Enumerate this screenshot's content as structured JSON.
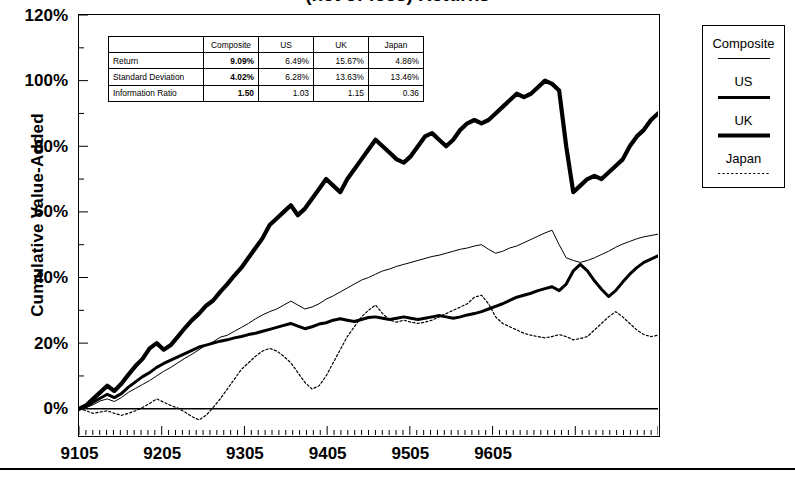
{
  "chart_data": {
    "type": "line",
    "title": "(net of fees) Returns",
    "xlabel": "",
    "ylabel": "Cumulative Value-Added",
    "ylim": [
      -8,
      120
    ],
    "yticks": [
      "0%",
      "20%",
      "40%",
      "60%",
      "80%",
      "100%",
      "120%"
    ],
    "ytick_values": [
      0,
      20,
      40,
      60,
      80,
      100,
      120
    ],
    "minor_tick_interval": 10,
    "xticks": [
      "9105",
      "9205",
      "9305",
      "9405",
      "9505",
      "9605"
    ],
    "xtick_values": [
      9105,
      9205,
      9305,
      9405,
      9505,
      9605
    ],
    "xlim": [
      9105,
      9612
    ],
    "grid": false,
    "legend_position": "right-outside",
    "series": [
      {
        "name": "Composite",
        "style": "thin-solid",
        "values": [
          0,
          0.4,
          1.2,
          2.4,
          3.0,
          2.2,
          3.4,
          5.0,
          6.2,
          7.4,
          8.6,
          10.0,
          11.4,
          12.6,
          14.0,
          15.4,
          16.6,
          18.0,
          19.4,
          20.4,
          21.8,
          22.4,
          23.6,
          24.8,
          26.0,
          27.4,
          28.6,
          29.6,
          30.4,
          31.6,
          32.8,
          31.6,
          30.4,
          31.0,
          32.0,
          33.4,
          34.4,
          35.6,
          36.8,
          38.0,
          39.2,
          40.0,
          41.0,
          42.0,
          42.6,
          43.4,
          44.0,
          44.6,
          45.2,
          45.8,
          46.4,
          46.8,
          47.4,
          48.0,
          48.6,
          49.0,
          49.6,
          50.0,
          48.6,
          47.4,
          48.0,
          49.0,
          49.6,
          50.6,
          51.6,
          52.6,
          53.6,
          54.4,
          50.0,
          46.0,
          45.2,
          44.6,
          45.2,
          46.0,
          47.0,
          48.0,
          49.2,
          50.2,
          51.0,
          51.8,
          52.4,
          52.8,
          53.2
        ]
      },
      {
        "name": "US",
        "style": "thick-solid",
        "values": [
          0,
          0.6,
          2.0,
          3.2,
          4.4,
          3.4,
          4.6,
          6.6,
          8.2,
          9.8,
          11.0,
          12.6,
          13.8,
          14.8,
          15.8,
          16.8,
          17.8,
          18.8,
          19.4,
          20.0,
          20.6,
          21.0,
          21.6,
          22.0,
          22.6,
          23.0,
          23.6,
          24.2,
          24.8,
          25.4,
          26.0,
          25.2,
          24.4,
          25.0,
          25.8,
          26.2,
          27.0,
          27.4,
          27.0,
          26.6,
          27.2,
          27.8,
          28.0,
          27.6,
          27.2,
          27.6,
          28.0,
          27.6,
          27.2,
          27.6,
          28.0,
          28.4,
          28.0,
          27.6,
          28.0,
          28.6,
          29.0,
          29.6,
          30.4,
          31.2,
          32.0,
          33.0,
          34.0,
          34.6,
          35.2,
          36.0,
          36.6,
          37.2,
          36.0,
          38.0,
          42.0,
          44.0,
          42.0,
          39.0,
          36.4,
          34.2,
          36.0,
          38.6,
          41.0,
          43.0,
          44.6,
          45.6,
          46.6
        ]
      },
      {
        "name": "UK",
        "style": "extra-thick-solid",
        "values": [
          0,
          1.0,
          3.0,
          5.0,
          7.0,
          5.4,
          7.6,
          10.4,
          13.0,
          15.2,
          18.4,
          20.0,
          18.0,
          19.4,
          22.0,
          24.6,
          27.0,
          29.0,
          31.4,
          33.0,
          35.6,
          38.0,
          40.6,
          43.0,
          46.0,
          49.0,
          52.0,
          56.0,
          58.0,
          60.0,
          62.0,
          59.0,
          61.0,
          64.0,
          67.0,
          70.0,
          68.0,
          66.0,
          70.0,
          73.0,
          76.0,
          79.0,
          82.0,
          80.0,
          78.0,
          76.0,
          75.0,
          77.0,
          80.0,
          83.0,
          84.0,
          82.0,
          80.0,
          82.0,
          85.0,
          87.0,
          88.0,
          87.0,
          88.0,
          90.0,
          92.0,
          94.0,
          96.0,
          95.0,
          96.0,
          98.0,
          100.0,
          99.0,
          97.0,
          80.0,
          66.0,
          68.0,
          70.0,
          71.0,
          70.0,
          72.0,
          74.0,
          76.0,
          80.0,
          83.0,
          85.0,
          88.0,
          90.0
        ]
      },
      {
        "name": "Japan",
        "style": "dotted",
        "values": [
          0,
          -0.6,
          -1.4,
          -1.0,
          -0.6,
          -1.4,
          -2.0,
          -1.4,
          -0.6,
          0.4,
          1.6,
          3.0,
          2.0,
          1.0,
          0.2,
          -1.0,
          -2.4,
          -3.4,
          -2.0,
          0.4,
          3.0,
          6.0,
          9.0,
          12.0,
          14.0,
          16.0,
          17.6,
          18.4,
          17.6,
          16.0,
          14.0,
          11.0,
          8.0,
          6.0,
          7.0,
          10.0,
          14.0,
          18.0,
          22.0,
          25.0,
          28.0,
          30.0,
          31.6,
          29.0,
          27.0,
          26.4,
          27.0,
          26.4,
          26.0,
          26.4,
          27.0,
          28.0,
          29.0,
          30.0,
          31.0,
          32.0,
          34.0,
          34.6,
          32.0,
          28.0,
          26.0,
          25.0,
          24.0,
          23.0,
          22.4,
          22.0,
          21.6,
          22.0,
          22.6,
          22.0,
          21.0,
          21.4,
          22.0,
          24.0,
          26.0,
          28.0,
          29.6,
          28.0,
          26.0,
          24.0,
          22.6,
          22.0,
          22.4
        ]
      }
    ]
  },
  "stats_table": {
    "col_headers": [
      "",
      "Composite",
      "US",
      "UK",
      "Japan"
    ],
    "rows": [
      {
        "label": "Return",
        "values": [
          "9.09%",
          "6.49%",
          "15.67%",
          "4.86%"
        ]
      },
      {
        "label": "Standard Deviation",
        "values": [
          "4.02%",
          "6.28%",
          "13.63%",
          "13.46%"
        ]
      },
      {
        "label": "Information Ratio",
        "values": [
          "1.50",
          "1.03",
          "1.15",
          "0.36"
        ]
      }
    ],
    "highlight_column": "Composite"
  },
  "legend": {
    "items": [
      {
        "label": "Composite",
        "style": "thin-solid"
      },
      {
        "label": "US",
        "style": "thick-solid"
      },
      {
        "label": "UK",
        "style": "extra-thick-solid"
      },
      {
        "label": "Japan",
        "style": "dotted"
      }
    ]
  }
}
